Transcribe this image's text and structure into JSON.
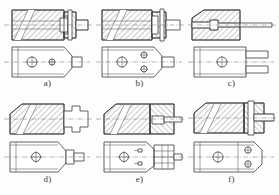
{
  "figure": {
    "kind": "mechanical-engineering-orthographic-drawing",
    "sheet_background": "#fdfdfc",
    "line_color": "#3b3b3b",
    "centerline_color": "#6a6a6a",
    "panel_count": 6,
    "panels": [
      {
        "id": "a",
        "label": "a)",
        "views": [
          "sectional-front-view",
          "plan-view"
        ],
        "features": {
          "body": "rectangular block with chamfered right end",
          "section_hatching": "diagonal, two directions",
          "slot": "long inclined through-slot",
          "right_end": "stepped boss with central pin / bolt",
          "plan_holes": [
            "large-circle-with-crosshair",
            "small-circle"
          ],
          "plan_tab": "small rectangular tab at right",
          "centerline": "horizontal through both views"
        }
      },
      {
        "id": "b",
        "label": "b)",
        "views": [
          "sectional-front-view",
          "plan-view"
        ],
        "features": {
          "body": "rectangular block with chamfered right end",
          "section_hatching": "diagonal, two directions",
          "slot": "long inclined through-slot",
          "right_end": "stepped boss with central pin / bolt",
          "plan_holes": [
            "large-circle-with-crosshair",
            "small-circle-upper",
            "small-circle-lower"
          ],
          "plan_tab": "small rectangular tab at right",
          "centerline": "horizontal through both views"
        }
      },
      {
        "id": "c",
        "label": "c)",
        "views": [
          "sectional-front-view",
          "plan-view"
        ],
        "features": {
          "body": "rectangular block with chamfered top-left corner",
          "section_hatching": "diagonal, single direction",
          "bore": "stepped horizontal bore with long projecting rod",
          "plan_holes": [
            "large-circle-with-crosshair"
          ],
          "plan_tab": "two stacked rectangular tabs at right",
          "centerline": "horizontal through both views"
        }
      },
      {
        "id": "d",
        "label": "d)",
        "views": [
          "sectional-front-view",
          "plan-view"
        ],
        "features": {
          "body": "rectangular block with chamfered top-left corner",
          "section_hatching": "diagonal, single direction",
          "slot": "long inclined through-slot",
          "right_end": "cross-shaped / T-head projection",
          "plan_holes": [
            "large-circle-with-crosshair"
          ],
          "plan_tab": "stepped tab at right",
          "centerline": "horizontal through both views"
        }
      },
      {
        "id": "e",
        "label": "e)",
        "views": [
          "sectional-front-view",
          "plan-view"
        ],
        "features": {
          "body": "rectangular block with chamfered top-left corner",
          "section_hatching": "diagonal, two directions",
          "slot": "long inclined through-slot",
          "right_end": "hatched block with projecting rod",
          "plan_holes": [
            "large-circle-with-crosshair",
            "small-arrow-feature-upper",
            "small-arrow-feature-lower"
          ],
          "plan_detail": "hatched detail region at right with projecting rod",
          "centerline": "horizontal through both views"
        }
      },
      {
        "id": "f",
        "label": "f)",
        "views": [
          "sectional-front-view",
          "plan-view"
        ],
        "features": {
          "body": "rectangular block with chamfered top-left corner",
          "section_hatching": "diagonal, two directions",
          "slot": "long inclined through-slot",
          "right_end": "vertical bar with projecting pin / bolt",
          "plan_holes": [
            "large-circle-with-crosshair",
            "small-circle-upper",
            "small-circle-lower"
          ],
          "plan_tab": "chamfered right end",
          "centerline": "horizontal through both views"
        }
      }
    ]
  }
}
